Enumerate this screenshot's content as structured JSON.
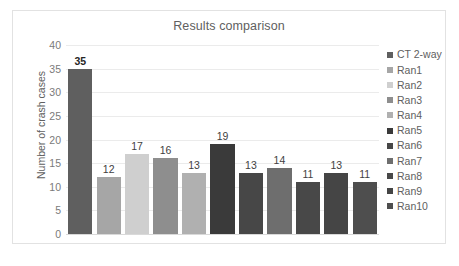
{
  "chart_data": {
    "type": "bar",
    "title": "Results comparison",
    "xlabel": "",
    "ylabel": "Number of crash cases",
    "ylim": [
      0,
      40
    ],
    "ytick_step": 5,
    "yticks": [
      40,
      35,
      30,
      25,
      20,
      15,
      10,
      5,
      0
    ],
    "grid": true,
    "legend_position": "right",
    "categories": [
      "CT 2-way",
      "Ran1",
      "Ran2",
      "Ran3",
      "Ran4",
      "Ran5",
      "Ran6",
      "Ran7",
      "Ran8",
      "Ran9",
      "Ran10"
    ],
    "values": [
      35,
      12,
      17,
      16,
      13,
      19,
      13,
      14,
      11,
      13,
      11
    ],
    "data_labels": [
      "35",
      "12",
      "17",
      "16",
      "13",
      "19",
      "13",
      "14",
      "11",
      "13",
      "11"
    ],
    "emphasized_label_index": 0,
    "colors": [
      "#5f5f5f",
      "#a6a6a6",
      "#cfcfcf",
      "#8e8e8e",
      "#b0b0b0",
      "#3a3a3a",
      "#474747",
      "#6e6e6e",
      "#484848",
      "#454545",
      "#4e4e4e"
    ],
    "series_name": "Number of crash cases"
  },
  "legend": {
    "items": [
      {
        "label": "CT 2-way",
        "color": "#5f5f5f"
      },
      {
        "label": "Ran1",
        "color": "#a6a6a6"
      },
      {
        "label": "Ran2",
        "color": "#cfcfcf"
      },
      {
        "label": "Ran3",
        "color": "#8e8e8e"
      },
      {
        "label": "Ran4",
        "color": "#b0b0b0"
      },
      {
        "label": "Ran5",
        "color": "#3a3a3a"
      },
      {
        "label": "Ran6",
        "color": "#474747"
      },
      {
        "label": "Ran7",
        "color": "#6e6e6e"
      },
      {
        "label": "Ran8",
        "color": "#484848"
      },
      {
        "label": "Ran9",
        "color": "#454545"
      },
      {
        "label": "Ran10",
        "color": "#4e4e4e"
      }
    ]
  },
  "style": {
    "background": "#ffffff",
    "frame_border": "#e2e2e2",
    "gridline": "#ebebeb",
    "axis_line": "#d9d9d9",
    "text": "#606060",
    "label_text": "#3f3f3f"
  }
}
